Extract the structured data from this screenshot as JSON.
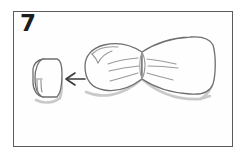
{
  "panel": {
    "step_number": "7",
    "background_color": "#ffffff",
    "frame_color": "#5b5b5b",
    "frame_fill": "#fefefe",
    "ink_color": "#6e6e6e",
    "shadow_color": "#c9c9c9",
    "arrow_color": "#3a3a3a",
    "number_color": "#1d1d1d"
  },
  "diagram": {
    "objects": [
      {
        "name": "napkin-ring",
        "label": "cylindrical ring",
        "position": "left"
      },
      {
        "name": "direction-arrow",
        "label": "insert direction arrow",
        "direction": "left"
      },
      {
        "name": "bow-shape",
        "label": "gathered bow-tie cloth",
        "position": "right"
      }
    ]
  }
}
